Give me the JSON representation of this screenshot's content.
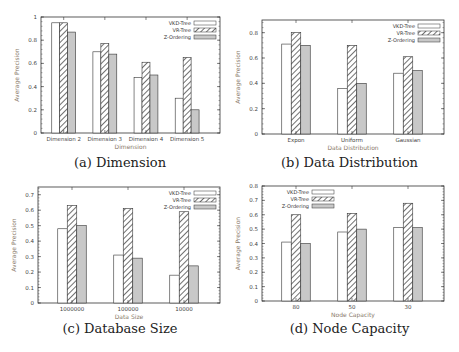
{
  "colors": {
    "vkd_fill": "#ffffff",
    "vr_hatch": "#333333",
    "z_fill": "#c8c8c8",
    "axis": "#333333",
    "ylabel": "#8a7a6a"
  },
  "legend": [
    "VKD-Tree",
    "VR-Tree",
    "Z-Ordering"
  ],
  "captions": {
    "a": "(a) Dimension",
    "b": "(b) Data Distribution",
    "c": "(c) Database Size",
    "d": "(d) Node Capacity"
  },
  "chart_data": [
    {
      "id": "a",
      "type": "bar",
      "title": "(a) Dimension",
      "xlabel": "Dimension",
      "ylabel": "Average Precision",
      "ylim": [
        0,
        1
      ],
      "yticks": [
        0,
        0.2,
        0.4,
        0.6,
        0.8,
        1
      ],
      "categories": [
        "Dimension 2",
        "Dimension 3",
        "Dimension 4",
        "Dimension 5"
      ],
      "series": [
        {
          "name": "VKD-Tree",
          "values": [
            0.95,
            0.7,
            0.48,
            0.3
          ]
        },
        {
          "name": "VR-Tree",
          "values": [
            0.95,
            0.77,
            0.61,
            0.65
          ]
        },
        {
          "name": "Z-Ordering",
          "values": [
            0.87,
            0.68,
            0.5,
            0.2
          ]
        }
      ],
      "legend_position": "top-right",
      "grid": false
    },
    {
      "id": "b",
      "type": "bar",
      "title": "(b) Data Distribution",
      "xlabel": "Data Distribution",
      "ylabel": "Average Precision",
      "ylim": [
        0,
        0.9
      ],
      "yticks": [
        0,
        0.2,
        0.4,
        0.6,
        0.8
      ],
      "categories": [
        "Expon",
        "Uniform",
        "Gaussian"
      ],
      "series": [
        {
          "name": "VKD-Tree",
          "values": [
            0.71,
            0.36,
            0.48
          ]
        },
        {
          "name": "VR-Tree",
          "values": [
            0.8,
            0.7,
            0.61
          ]
        },
        {
          "name": "Z-Ordering",
          "values": [
            0.7,
            0.4,
            0.5
          ]
        }
      ],
      "legend_position": "top-right",
      "grid": false
    },
    {
      "id": "c",
      "type": "bar",
      "title": "(c) Database Size",
      "xlabel": "Data Size",
      "ylabel": "Average Precision",
      "ylim": [
        0,
        0.75
      ],
      "yticks": [
        0,
        0.1,
        0.2,
        0.3,
        0.4,
        0.5,
        0.6,
        0.7
      ],
      "categories": [
        "1000000",
        "100000",
        "10000"
      ],
      "series": [
        {
          "name": "VKD-Tree",
          "values": [
            0.48,
            0.31,
            0.18
          ]
        },
        {
          "name": "VR-Tree",
          "values": [
            0.63,
            0.61,
            0.59
          ]
        },
        {
          "name": "Z-Ordering",
          "values": [
            0.5,
            0.29,
            0.24
          ]
        }
      ],
      "legend_position": "top-right",
      "grid": false
    },
    {
      "id": "d",
      "type": "bar",
      "title": "(d) Node Capacity",
      "xlabel": "Node Capacity",
      "ylabel": "Average Precision",
      "ylim": [
        0,
        0.8
      ],
      "yticks": [
        0,
        0.1,
        0.2,
        0.3,
        0.4,
        0.5,
        0.6,
        0.7,
        0.8
      ],
      "categories": [
        "80",
        "50",
        "30"
      ],
      "series": [
        {
          "name": "VKD-Tree",
          "values": [
            0.41,
            0.48,
            0.51
          ]
        },
        {
          "name": "VR-Tree",
          "values": [
            0.6,
            0.61,
            0.68
          ]
        },
        {
          "name": "Z-Ordering",
          "values": [
            0.4,
            0.5,
            0.51
          ]
        }
      ],
      "legend_position": "top-left",
      "grid": false
    }
  ]
}
